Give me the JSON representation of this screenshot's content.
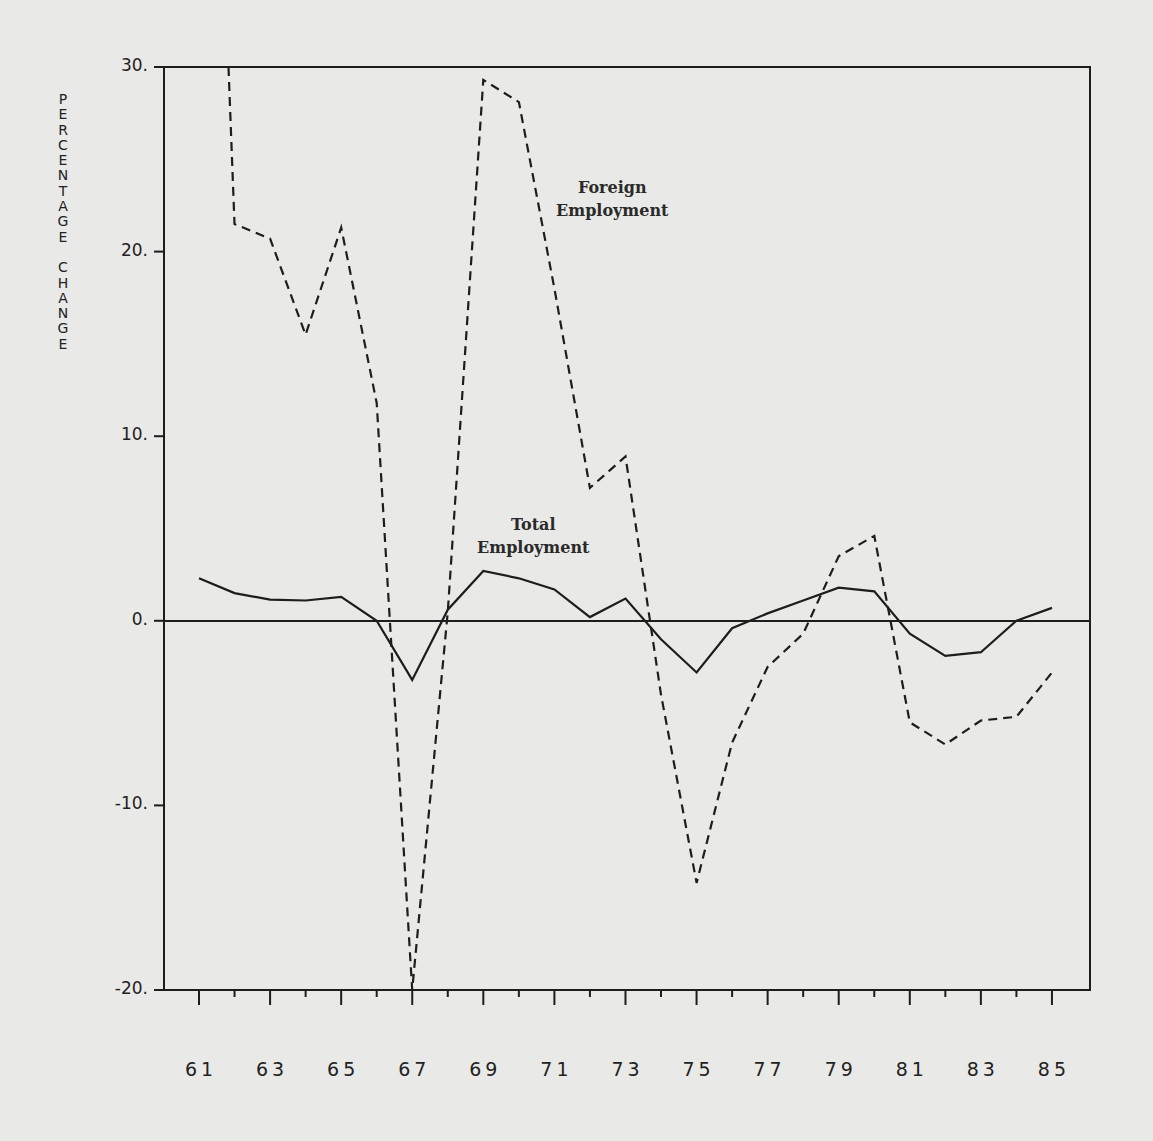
{
  "chart_data": {
    "type": "line",
    "title": "",
    "xlabel": "",
    "ylabel": "PERCENTAGE CHANGE",
    "ylim": [
      -20,
      30
    ],
    "xlim": [
      61,
      85
    ],
    "grid": false,
    "legend": "none (inline annotations)",
    "x": [
      61,
      62,
      63,
      64,
      65,
      66,
      67,
      68,
      69,
      70,
      71,
      72,
      73,
      74,
      75,
      76,
      77,
      78,
      79,
      80,
      81,
      82,
      83,
      84,
      85
    ],
    "x_tick_labels": [
      "61",
      "63",
      "65",
      "67",
      "69",
      "71",
      "73",
      "75",
      "77",
      "79",
      "81",
      "83",
      "85"
    ],
    "y_tick_labels": [
      "30.",
      "20.",
      "10.",
      "0.",
      "-10.",
      "-20."
    ],
    "y_ticks": [
      30,
      20,
      10,
      0,
      -10,
      -20
    ],
    "series": [
      {
        "name": "Foreign Employment",
        "style": "dashed",
        "values": [
          null,
          21.5,
          20.7,
          15.5,
          21.3,
          11.8,
          -20.0,
          0.5,
          29.3,
          28.1,
          18.0,
          7.2,
          8.9,
          -4.0,
          -14.2,
          -6.6,
          -2.5,
          -0.7,
          3.5,
          4.6,
          -5.5,
          -6.7,
          -5.4,
          -5.2,
          -2.8
        ],
        "note": "1961 value is above the plotted range (clipped at 30)"
      },
      {
        "name": "Total Employment",
        "style": "solid",
        "values": [
          2.3,
          1.5,
          1.15,
          1.1,
          1.3,
          0.0,
          -3.2,
          0.6,
          2.7,
          2.3,
          1.7,
          0.2,
          1.2,
          -1.0,
          -2.8,
          -0.4,
          0.4,
          1.1,
          1.8,
          1.6,
          -0.7,
          -1.9,
          -1.7,
          0.0,
          0.7
        ]
      }
    ],
    "annotations": [
      {
        "text": "Foreign\nEmployment",
        "near": {
          "x": 71,
          "y": 23
        }
      },
      {
        "text": "Total\nEmployment",
        "near": {
          "x": 69,
          "y": 5
        }
      }
    ]
  },
  "labels": {
    "ylabel_letters": [
      "P",
      "E",
      "R",
      "C",
      "E",
      "N",
      "T",
      "A",
      "G",
      "E",
      " ",
      "C",
      "H",
      "A",
      "N",
      "G",
      "E"
    ],
    "foreign": "Foreign\nEmployment",
    "total": "Total\nEmployment",
    "y": [
      "30.",
      "20.",
      "10.",
      "0.",
      "-10.",
      "-20."
    ],
    "x": [
      "61",
      "63",
      "65",
      "67",
      "69",
      "71",
      "73",
      "75",
      "77",
      "79",
      "81",
      "83",
      "85"
    ]
  },
  "colors": {
    "background": "#e9e9e7",
    "ink": "#1d1d1d"
  }
}
